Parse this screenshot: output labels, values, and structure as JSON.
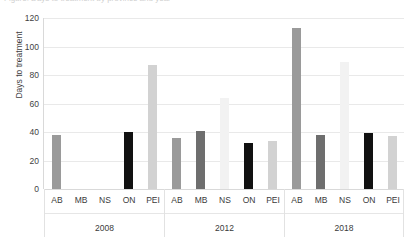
{
  "title_sliver": "Figure: Days to treatment by province and year",
  "chart_data": {
    "type": "bar",
    "title": "",
    "xlabel": "",
    "ylabel": "Days to treatment",
    "ylim": [
      0,
      120
    ],
    "yticks": [
      0,
      20,
      40,
      60,
      80,
      100,
      120
    ],
    "grid": true,
    "legend": "none",
    "categories": [
      "AB",
      "MB",
      "NS",
      "ON",
      "PEI"
    ],
    "groups": [
      "2008",
      "2012",
      "2018"
    ],
    "series": [
      {
        "name": "2008",
        "values": [
          38,
          null,
          null,
          40,
          87
        ]
      },
      {
        "name": "2012",
        "values": [
          36,
          41,
          64,
          32,
          34
        ]
      },
      {
        "name": "2018",
        "values": [
          113,
          38,
          89,
          39,
          37
        ]
      }
    ],
    "category_colors": {
      "AB": "#9a9a9a",
      "MB": "#6e6e6e",
      "NS": "#f2f2f2",
      "ON": "#111111",
      "PEI": "#d2d2d2"
    }
  }
}
